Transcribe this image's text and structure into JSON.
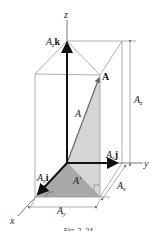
{
  "figure": {
    "caption": "Fig. 2–24",
    "colors": {
      "box_line": "#9a9a9a",
      "axis": "#555555",
      "vector": "#111111",
      "shade_light": "#d4d4d4",
      "shade_dark": "#a8a8a8"
    },
    "axes": {
      "x_label": "x",
      "y_label": "y",
      "z_label": "z"
    },
    "vectors": {
      "resultant_label": "A",
      "magnitude_label": "A",
      "projection_label": "A′",
      "x_component": {
        "main": "A",
        "sub": "x",
        "unit": "i"
      },
      "y_component": {
        "main": "A",
        "sub": "y",
        "unit": "j"
      },
      "z_component": {
        "main": "A",
        "sub": "z",
        "unit": "k"
      }
    },
    "dimensions": {
      "z": {
        "main": "A",
        "sub": "z"
      },
      "x": {
        "main": "A",
        "sub": "x"
      },
      "y": {
        "main": "A",
        "sub": "y"
      }
    }
  }
}
